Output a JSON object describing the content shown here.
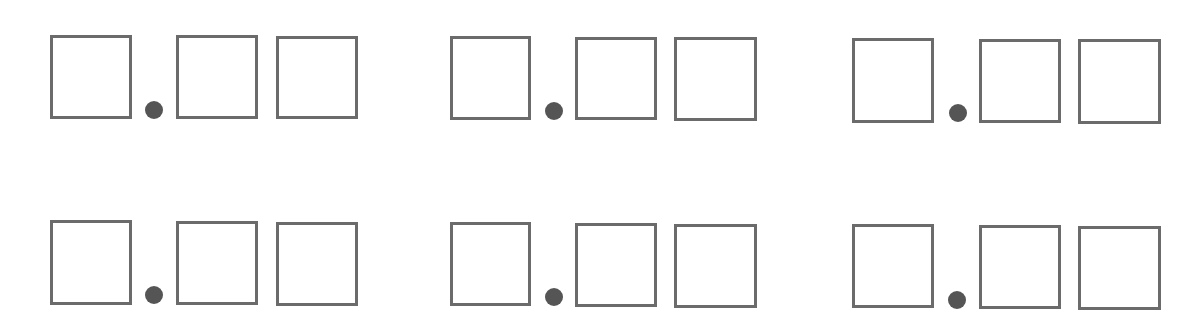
{
  "worksheet": {
    "description": "Decimal number templates: one whole-number box, a decimal point, and two decimal-place boxes",
    "colors": {
      "box_border": "#6b6b6b",
      "dot": "#555555",
      "background": "#ffffff"
    },
    "groups": [
      {
        "row": 1,
        "col": 1,
        "boxes": [
          {
            "x": 50,
            "y": 35,
            "w": 82,
            "h": 84
          },
          {
            "x": 176,
            "y": 35,
            "w": 82,
            "h": 84
          },
          {
            "x": 276,
            "y": 36,
            "w": 82,
            "h": 83
          }
        ],
        "dot": {
          "cx": 154,
          "cy": 110,
          "r": 9
        }
      },
      {
        "row": 1,
        "col": 2,
        "boxes": [
          {
            "x": 450,
            "y": 36,
            "w": 81,
            "h": 84
          },
          {
            "x": 575,
            "y": 37,
            "w": 82,
            "h": 83
          },
          {
            "x": 674,
            "y": 37,
            "w": 83,
            "h": 84
          }
        ],
        "dot": {
          "cx": 554,
          "cy": 111,
          "r": 9
        }
      },
      {
        "row": 1,
        "col": 3,
        "boxes": [
          {
            "x": 852,
            "y": 38,
            "w": 82,
            "h": 85
          },
          {
            "x": 979,
            "y": 39,
            "w": 82,
            "h": 84
          },
          {
            "x": 1078,
            "y": 39,
            "w": 83,
            "h": 85
          }
        ],
        "dot": {
          "cx": 958,
          "cy": 113,
          "r": 9
        }
      },
      {
        "row": 2,
        "col": 1,
        "boxes": [
          {
            "x": 50,
            "y": 220,
            "w": 82,
            "h": 85
          },
          {
            "x": 176,
            "y": 221,
            "w": 82,
            "h": 84
          },
          {
            "x": 276,
            "y": 222,
            "w": 82,
            "h": 84
          }
        ],
        "dot": {
          "cx": 154,
          "cy": 295,
          "r": 9
        }
      },
      {
        "row": 2,
        "col": 2,
        "boxes": [
          {
            "x": 450,
            "y": 222,
            "w": 81,
            "h": 84
          },
          {
            "x": 575,
            "y": 223,
            "w": 82,
            "h": 84
          },
          {
            "x": 674,
            "y": 224,
            "w": 83,
            "h": 84
          }
        ],
        "dot": {
          "cx": 554,
          "cy": 297,
          "r": 9
        }
      },
      {
        "row": 2,
        "col": 3,
        "boxes": [
          {
            "x": 852,
            "y": 224,
            "w": 82,
            "h": 84
          },
          {
            "x": 979,
            "y": 225,
            "w": 82,
            "h": 84
          },
          {
            "x": 1078,
            "y": 226,
            "w": 83,
            "h": 84
          }
        ],
        "dot": {
          "cx": 957,
          "cy": 300,
          "r": 9
        }
      }
    ]
  }
}
